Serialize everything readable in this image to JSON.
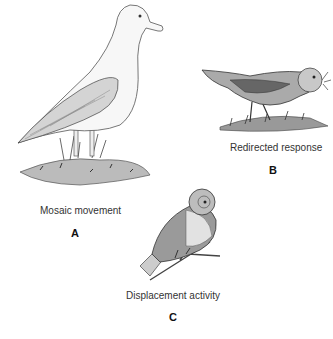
{
  "figure": {
    "panels": [
      {
        "id": "A",
        "caption": "Mosaic movement",
        "letter": "A",
        "subject": "standing gull on grassy mound"
      },
      {
        "id": "B",
        "caption": "Redirected response",
        "letter": "B",
        "subject": "bird pulling grass in beak"
      },
      {
        "id": "C",
        "caption": "Displacement activity",
        "letter": "C",
        "subject": "perched bird preening"
      }
    ]
  }
}
